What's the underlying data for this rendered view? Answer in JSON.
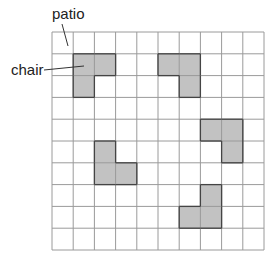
{
  "labels": {
    "patio": "patio",
    "chair": "chair"
  },
  "grid": {
    "columns": 10,
    "rows": 10,
    "origin_x": 52,
    "origin_y": 32,
    "cell_w": 21.2,
    "cell_h": 21.8,
    "line_color": "#9a9a9a",
    "fill_color": "#c2c2c2",
    "shape_stroke": "#444444"
  },
  "chairs": [
    {
      "cells": [
        [
          1,
          1
        ],
        [
          2,
          1
        ],
        [
          1,
          2
        ]
      ]
    },
    {
      "cells": [
        [
          5,
          1
        ],
        [
          6,
          1
        ],
        [
          6,
          2
        ]
      ]
    },
    {
      "cells": [
        [
          7,
          4
        ],
        [
          8,
          4
        ],
        [
          8,
          5
        ]
      ]
    },
    {
      "cells": [
        [
          2,
          5
        ],
        [
          2,
          6
        ],
        [
          3,
          6
        ]
      ]
    },
    {
      "cells": [
        [
          7,
          7
        ],
        [
          6,
          8
        ],
        [
          7,
          8
        ]
      ]
    }
  ]
}
